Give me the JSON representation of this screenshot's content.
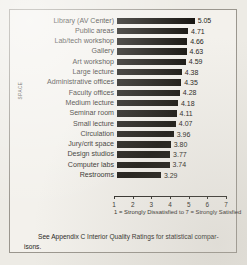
{
  "chart_data": {
    "type": "bar",
    "orientation": "horizontal",
    "title": "",
    "xlabel": "1 = Strongly Dissatisfied to 7 = Strongly Satisfied",
    "ylabel": "SPACE",
    "xlim": [
      1,
      7
    ],
    "xticks": [
      1,
      2,
      3,
      4,
      5,
      6,
      7
    ],
    "grid": false,
    "legend": null,
    "categories": [
      "Library (AV Center)",
      "Public areas",
      "Lab/tech workshop",
      "Gallery",
      "Art workshop",
      "Large lecture",
      "Administrative offices",
      "Faculty offices",
      "Medium lecture",
      "Seminar room",
      "Small lecture",
      "Circulation",
      "Jury/crit space",
      "Design studios",
      "Computer labs",
      "Restrooms"
    ],
    "values": [
      5.05,
      4.71,
      4.66,
      4.63,
      4.59,
      4.38,
      4.35,
      4.28,
      4.18,
      4.11,
      4.07,
      3.96,
      3.8,
      3.77,
      3.74,
      3.29
    ],
    "value_labels": [
      "5.05",
      "4.71",
      "4.66",
      "4.63",
      "4.59",
      "4.38",
      "4.35",
      "4.28",
      "4.18",
      "4.11",
      "4.07",
      "3.96",
      "3.80",
      "3.77",
      "3.74",
      "3.29"
    ],
    "bar_color": "#16140f"
  },
  "footer": {
    "line1": "See Appendix C Interior Quality Ratings for statistical compar-",
    "line2": "isons."
  }
}
